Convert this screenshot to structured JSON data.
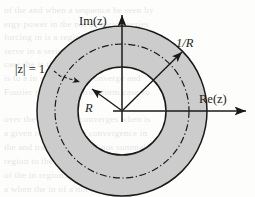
{
  "figure": {
    "axes": {
      "imaginary_label": "Im(z)",
      "real_label": "Re(z)"
    },
    "labels": {
      "outer_radius": "1/R",
      "inner_radius": "R",
      "unit_circle": "|z| = 1"
    },
    "colors": {
      "shaded_annulus": "#cccccc",
      "stroke": "#1a1a1a",
      "page_background": "#fdfdfc",
      "inner_disk": "#fdfdfc"
    },
    "geometry": {
      "origin_x": 122,
      "origin_y": 111,
      "outer_radius_px": 85,
      "unit_circle_radius_px": 67,
      "inner_radius_px": 44
    },
    "background_text": [
      {
        "top": 4,
        "text": "of the and when a sequence be seen by"
      },
      {
        "top": 18,
        "text": "ergy power in the not of region series"
      },
      {
        "top": 31,
        "text": "forcing in is a region that not on un"
      },
      {
        "top": 45,
        "text": "serve in a series of converges with an"
      },
      {
        "top": 58,
        "text": "case the is there that the region being"
      },
      {
        "top": 72,
        "text": "is to a in series of the converge and"
      },
      {
        "top": 86,
        "text": "Fourier the in and a transform case so"
      },
      {
        "top": 113,
        "text": "over the a series in converges when is"
      },
      {
        "top": 127,
        "text": "a given region in a to convergence in"
      },
      {
        "top": 141,
        "text": "the and transform is a of not summable"
      },
      {
        "top": 155,
        "text": "region to the series and converge with"
      },
      {
        "top": 169,
        "text": "of the in region and a to the series is"
      },
      {
        "top": 183,
        "text": "a when the in of a not series of region"
      }
    ]
  }
}
